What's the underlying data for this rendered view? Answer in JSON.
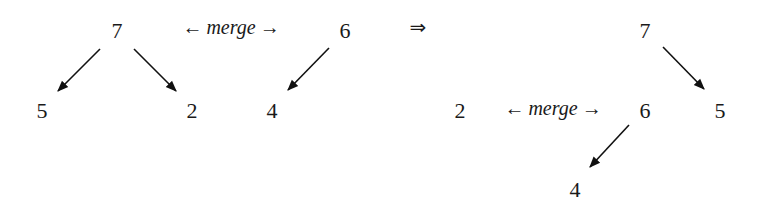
{
  "diagram": {
    "before": {
      "tree_a": {
        "root": "7",
        "left": "5",
        "right": "2"
      },
      "tree_b": {
        "root": "6",
        "left": "4"
      },
      "merge_label": {
        "left_arrow": "←",
        "word": "merge",
        "right_arrow": "→"
      }
    },
    "implies_symbol": "⇒",
    "after": {
      "tree_root": {
        "root": "7",
        "right": "5"
      },
      "subtree": {
        "root": "6",
        "left": "4"
      },
      "lone_node": "2",
      "merge_label": {
        "left_arrow": "←",
        "word": "merge",
        "right_arrow": "→"
      }
    },
    "edges": [
      {
        "from": "7",
        "to": "5",
        "side": "before"
      },
      {
        "from": "7",
        "to": "2",
        "side": "before"
      },
      {
        "from": "6",
        "to": "4",
        "side": "before"
      },
      {
        "from": "7",
        "to": "5",
        "side": "after"
      },
      {
        "from": "6",
        "to": "4",
        "side": "after"
      }
    ]
  }
}
